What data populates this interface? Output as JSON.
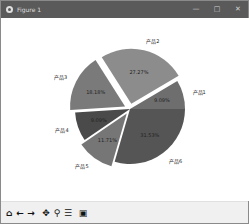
{
  "window": {
    "title": "Figure 1",
    "controls": {
      "minimize": "—",
      "maximize": "□",
      "close": "✕"
    }
  },
  "toolbar": {
    "buttons": [
      {
        "name": "home-icon",
        "glyph": "⌂"
      },
      {
        "name": "back-icon",
        "glyph": "←"
      },
      {
        "name": "forward-icon",
        "glyph": "→"
      },
      {
        "name": "pan-icon",
        "glyph": "✥"
      },
      {
        "name": "zoom-icon",
        "glyph": "⚲"
      },
      {
        "name": "configure-subplots-icon",
        "glyph": "☰"
      },
      {
        "name": "save-icon",
        "glyph": "▣"
      }
    ]
  },
  "chart_data": {
    "type": "pie",
    "title": "",
    "start_angle_deg": 0,
    "direction": "counterclockwise",
    "categories": [
      "产品1",
      "产品2",
      "产品3",
      "产品4",
      "产品5",
      "产品6"
    ],
    "values": [
      9.09,
      27.27,
      18.18,
      9.09,
      11.71,
      31.53
    ],
    "labels": [
      "9.09%",
      "27.27%",
      "18.18%",
      "9.09%",
      "11.71%",
      "31.53%"
    ],
    "explode": [
      0,
      0.1,
      0.1,
      0,
      0.1,
      0
    ],
    "colors": [
      "#6e6e6e",
      "#8c8c8c",
      "#7a7a7a",
      "#4a4a4a",
      "#767676",
      "#555555"
    ],
    "legend": null
  }
}
